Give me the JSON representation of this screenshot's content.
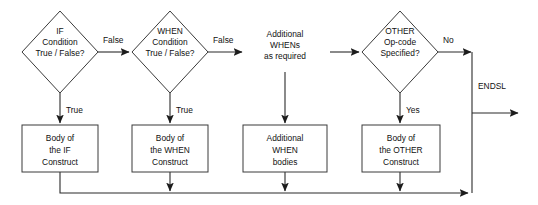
{
  "diagram": {
    "colors": {
      "background": "#ffffff",
      "shape_stroke": "#3a3a3a",
      "shape_fill": "#ffffff",
      "connector": "#2b2b2b",
      "text": "#111111"
    },
    "decisions": [
      {
        "id": "if-condition",
        "lines": [
          "IF",
          "Condition",
          "True / False?"
        ],
        "center": {
          "x": 60,
          "y": 52
        },
        "half_width": 38,
        "half_height": 41
      },
      {
        "id": "when-condition",
        "lines": [
          "WHEN",
          "Condition",
          "True / False?"
        ],
        "center": {
          "x": 170,
          "y": 52
        },
        "half_width": 38,
        "half_height": 41
      },
      {
        "id": "other-opcode",
        "lines": [
          "OTHER",
          "Op-code",
          "Specified?"
        ],
        "center": {
          "x": 400,
          "y": 52
        },
        "half_width": 38,
        "half_height": 41
      }
    ],
    "annotations": [
      {
        "id": "additional-whens",
        "lines": [
          "Additional",
          "WHENs",
          "as required"
        ],
        "center": {
          "x": 285,
          "y": 52
        }
      }
    ],
    "processes": [
      {
        "id": "if-body",
        "lines": [
          "Body of",
          "the IF",
          "Construct"
        ],
        "rect": {
          "x": 22,
          "y": 125,
          "width": 76,
          "height": 47
        }
      },
      {
        "id": "when-body",
        "lines": [
          "Body of",
          "the WHEN",
          "Construct"
        ],
        "rect": {
          "x": 132,
          "y": 125,
          "width": 76,
          "height": 47
        }
      },
      {
        "id": "additional-when-bodies",
        "lines": [
          "Additional",
          "WHEN",
          "bodies"
        ],
        "rect": {
          "x": 243,
          "y": 125,
          "width": 84,
          "height": 47
        }
      },
      {
        "id": "other-body",
        "lines": [
          "Body of",
          "the OTHER",
          "Construct"
        ],
        "rect": {
          "x": 362,
          "y": 125,
          "width": 78,
          "height": 47
        }
      }
    ],
    "edge_labels": [
      {
        "id": "if-false",
        "text": "False",
        "x": 103,
        "y": 40
      },
      {
        "id": "when-false",
        "text": "False",
        "x": 213,
        "y": 40
      },
      {
        "id": "other-no",
        "text": "No",
        "x": 443,
        "y": 40
      },
      {
        "id": "if-true",
        "text": "True",
        "x": 66,
        "y": 110
      },
      {
        "id": "when-true",
        "text": "True",
        "x": 176,
        "y": 110
      },
      {
        "id": "other-yes",
        "text": "Yes",
        "x": 406,
        "y": 110
      },
      {
        "id": "endsl",
        "text": "ENDSL",
        "x": 478,
        "y": 86
      }
    ]
  }
}
